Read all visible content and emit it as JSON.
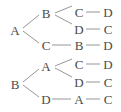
{
  "diagram": {
    "type": "tree-diagram",
    "trees": [
      {
        "root": "A",
        "branches": [
          {
            "node": "B",
            "children": [
              {
                "node": "C",
                "next": "D"
              },
              {
                "node": "D",
                "next": "C"
              }
            ]
          },
          {
            "node": "C",
            "children": [
              {
                "node": "B",
                "next": "D"
              }
            ]
          }
        ]
      },
      {
        "root": "B",
        "branches": [
          {
            "node": "A",
            "children": [
              {
                "node": "C",
                "next": "D"
              },
              {
                "node": "D",
                "next": "C"
              }
            ]
          },
          {
            "node": "D",
            "children": [
              {
                "node": "A",
                "next": "C"
              }
            ]
          }
        ]
      }
    ],
    "labels": {
      "t1_root": "A",
      "t1_b1": "B",
      "t1_b1_c1": "C",
      "t1_b1_c1_n": "D",
      "t1_b1_c2": "D",
      "t1_b1_c2_n": "C",
      "t1_b2": "C",
      "t1_b2_c1": "B",
      "t1_b2_c1_n": "D",
      "t2_root": "B",
      "t2_b1": "A",
      "t2_b1_c1": "C",
      "t2_b1_c1_n": "D",
      "t2_b1_c2": "D",
      "t2_b1_c2_n": "C",
      "t2_b2": "D",
      "t2_b2_c1": "A",
      "t2_b2_c1_n": "C"
    },
    "colors": {
      "text": "#4a4a4a",
      "lines": "#8a8a8a"
    }
  }
}
